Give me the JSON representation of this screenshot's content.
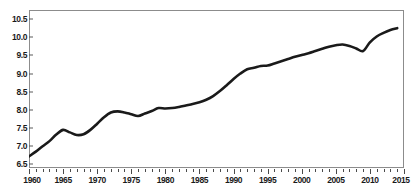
{
  "figure": {
    "top_remnant_text": "",
    "background_color": "#ffffff",
    "frame_color": "#8c8c8c",
    "line_color": "#1a1a1a",
    "text_color": "#1a1a1a"
  },
  "chart_data": {
    "type": "line",
    "title": "",
    "xlabel": "",
    "ylabel": "",
    "xlim": [
      1960,
      2015
    ],
    "ylim": [
      6.4,
      10.75
    ],
    "grid": false,
    "legend": null,
    "y_ticks": [
      6.5,
      7.0,
      7.5,
      8.0,
      8.5,
      9.0,
      9.5,
      10.0,
      10.5
    ],
    "y_tick_labels": [
      "6.5",
      "7.0",
      "7.5",
      "8.0",
      "8.5",
      "9.0",
      "9.5",
      "10.0",
      "10.5"
    ],
    "x_ticks_major": [
      1960,
      1965,
      1970,
      1975,
      1980,
      1985,
      1990,
      1995,
      2000,
      2005,
      2010,
      2015
    ],
    "x_tick_labels": [
      "1960",
      "1965",
      "1970",
      "1975",
      "1980",
      "1985",
      "1990",
      "1995",
      "2000",
      "2005",
      "2010",
      "2015"
    ],
    "x_minor_tick_interval": 1,
    "series": [
      {
        "name": "series-1",
        "color": "#1a1a1a",
        "line_width": 2.6,
        "x": [
          1960,
          1961,
          1962,
          1963,
          1964,
          1965,
          1966,
          1967,
          1968,
          1969,
          1970,
          1971,
          1972,
          1973,
          1974,
          1975,
          1976,
          1977,
          1978,
          1979,
          1980,
          1981,
          1982,
          1983,
          1984,
          1985,
          1986,
          1987,
          1988,
          1989,
          1990,
          1991,
          1992,
          1993,
          1994,
          1995,
          1996,
          1997,
          1998,
          1999,
          2000,
          2001,
          2002,
          2003,
          2004,
          2005,
          2006,
          2007,
          2008,
          2009,
          2010,
          2011,
          2012,
          2013,
          2014
        ],
        "values": [
          6.72,
          6.85,
          7.0,
          7.14,
          7.32,
          7.45,
          7.38,
          7.31,
          7.33,
          7.45,
          7.62,
          7.8,
          7.93,
          7.96,
          7.93,
          7.88,
          7.83,
          7.9,
          7.97,
          8.05,
          8.04,
          8.05,
          8.08,
          8.12,
          8.16,
          8.21,
          8.28,
          8.38,
          8.52,
          8.68,
          8.85,
          9.0,
          9.12,
          9.16,
          9.21,
          9.22,
          9.28,
          9.34,
          9.4,
          9.46,
          9.51,
          9.56,
          9.62,
          9.68,
          9.74,
          9.78,
          9.8,
          9.76,
          9.69,
          9.62,
          9.86,
          10.02,
          10.12,
          10.2,
          10.25
        ]
      }
    ]
  }
}
